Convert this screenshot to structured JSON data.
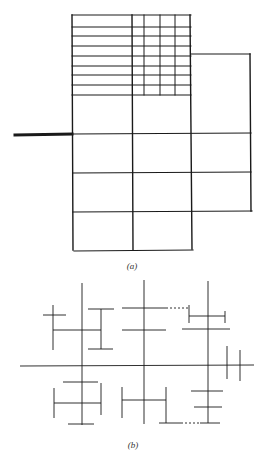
{
  "figure": {
    "stroke_color": "#1a1a1a",
    "panel_a": {
      "label": "(a)",
      "description": "Adaptive mesh refinement grid with locally refined fine cells in upper region",
      "coarse_columns_x": [
        72,
        132,
        191,
        250
      ],
      "coarse_rows_y": [
        95,
        134,
        173,
        212,
        250
      ],
      "fine_rows_y": [
        15,
        27,
        36,
        46,
        56,
        66,
        75,
        85,
        95
      ],
      "fine_columns_x": [
        132,
        144,
        160,
        175,
        191
      ],
      "right_box_top_y": 54,
      "heavy_line": {
        "x1": 15,
        "x2": 72,
        "y": 134
      }
    },
    "panel_b": {
      "label": "(b)",
      "description": "Hierarchical tree / H-tree style line structure with dotted connectors"
    }
  }
}
